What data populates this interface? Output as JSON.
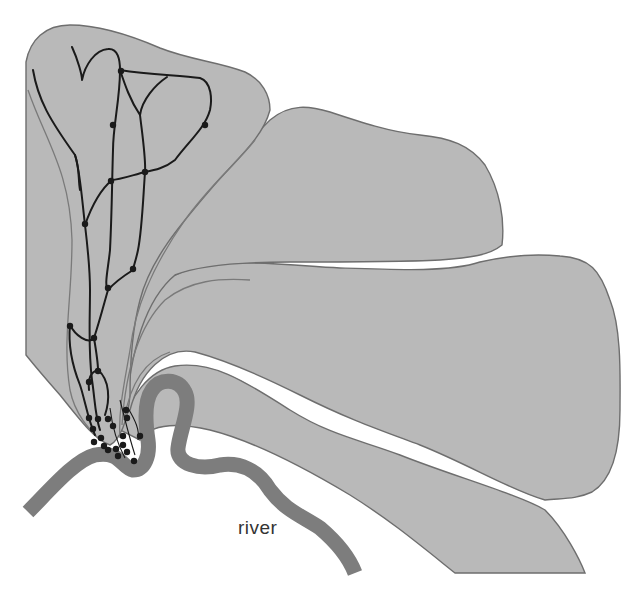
{
  "diagram": {
    "type": "fan / delta deposition schematic",
    "labels": {
      "river": "river"
    },
    "colors": {
      "background": "#ffffff",
      "lobe_fill": "#b9b9b9",
      "lobe_outline": "#6e6e6e",
      "river": "#7d7d7d",
      "channels": "#1a1a1a"
    },
    "lobes": [
      {
        "id": "lobe-1",
        "position": "upper-left (active, with channel network)"
      },
      {
        "id": "lobe-2",
        "position": "upper-middle"
      },
      {
        "id": "lobe-3",
        "position": "right"
      },
      {
        "id": "lobe-4",
        "position": "lower-right"
      }
    ],
    "features": [
      "distributary channel network with junction nodes",
      "cluster of nodes near river bend (apex)",
      "meandering river along bottom"
    ]
  }
}
